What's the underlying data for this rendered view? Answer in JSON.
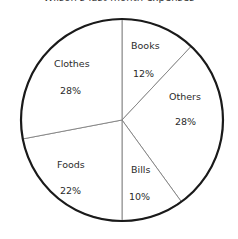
{
  "chart_data": {
    "type": "pie",
    "title": "Wilson's last month expenses",
    "xlabel": "",
    "ylabel": "",
    "grid": false,
    "legend": "none",
    "start_angle_deg": 0,
    "direction": "clockwise",
    "total": 100,
    "unit": "%",
    "categories": [
      "Books",
      "Others",
      "Bills",
      "Foods",
      "Clothes"
    ],
    "values": [
      12,
      28,
      10,
      22,
      28
    ],
    "slices": [
      {
        "name": "Books",
        "value": 12,
        "label": "Books",
        "value_label": "12%",
        "label_x": 131,
        "label_y": 41,
        "value_x": 133,
        "value_y": 69
      },
      {
        "name": "Others",
        "value": 28,
        "label": "Others",
        "value_label": "28%",
        "label_x": 169,
        "label_y": 92,
        "value_x": 175,
        "value_y": 117
      },
      {
        "name": "Bills",
        "value": 10,
        "label": "Bills",
        "value_label": "10%",
        "label_x": 131,
        "label_y": 165,
        "value_x": 129,
        "value_y": 192
      },
      {
        "name": "Foods",
        "value": 22,
        "label": "Foods",
        "value_label": "22%",
        "label_x": 57,
        "label_y": 160,
        "value_x": 60,
        "value_y": 186
      },
      {
        "name": "Clothes",
        "value": 28,
        "label": "Clothes",
        "value_label": "28%",
        "label_x": 54,
        "label_y": 59,
        "value_x": 60,
        "value_y": 86
      }
    ],
    "geometry": {
      "center_x": 122,
      "center_y": 120,
      "radius": 101
    },
    "colors": {
      "slice_fill": "#ffffff",
      "slice_divider": "#808080",
      "outline": "#1a1a1a",
      "text": "#2b2b2b",
      "background": "#ffffff"
    }
  }
}
